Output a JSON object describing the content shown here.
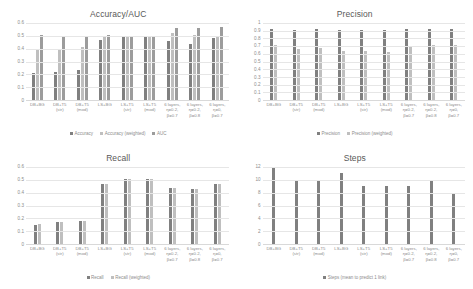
{
  "colors": {
    "series1": "#808080",
    "series2": "#bfbfbf",
    "series3": "#9c9c9c",
    "text": "#8c8c8c",
    "title": "#595959",
    "gridline": "#e6e6e6",
    "axis": "#d9d9d9",
    "background": "#ffffff"
  },
  "categories": [
    "DB+BG",
    "DB+T5\n(str)",
    "DB+T5\n(mod)",
    "LS+BG",
    "LS+T5\n(str)",
    "LS+T5\n(mod)",
    "6 layers,\nη=0.2,\nβ=0.7",
    "6 layers,\nη=0.2,\nβ=0.8",
    "6 layers,\nη=0,\nβ=0.7"
  ],
  "chart_data": [
    {
      "type": "bar",
      "title": "Accuracy/AUC",
      "xlabel": "",
      "ylabel": "",
      "ylim": [
        0,
        0.6
      ],
      "yticks": [
        0,
        0.1,
        0.2,
        0.3,
        0.4,
        0.5,
        0.6
      ],
      "ytick_labels": [
        "0",
        "0.1",
        "0.2",
        "0.3",
        "0.4",
        "0.5",
        "0.6"
      ],
      "grid": true,
      "legend_position": "bottom",
      "categories": [
        "DB+BG",
        "DB+T5\n(str)",
        "DB+T5\n(mod)",
        "LS+BG",
        "LS+T5\n(str)",
        "LS+T5\n(mod)",
        "6 layers,\nη=0.2,\nβ=0.7",
        "6 layers,\nη=0.2,\nβ=0.8",
        "6 layers,\nη=0,\nβ=0.7"
      ],
      "series": [
        {
          "name": "Accuracy",
          "color": "#808080",
          "values": [
            0.21,
            0.22,
            0.23,
            0.47,
            0.5,
            0.5,
            0.46,
            0.44,
            0.48
          ]
        },
        {
          "name": "Accuracy (weighted)",
          "color": "#bfbfbf",
          "values": [
            0.4,
            0.4,
            0.41,
            0.49,
            0.5,
            0.5,
            0.52,
            0.51,
            0.5
          ]
        },
        {
          "name": "AUC",
          "color": "#9c9c9c",
          "values": [
            0.51,
            0.5,
            0.5,
            0.51,
            0.5,
            0.5,
            0.56,
            0.56,
            0.57
          ]
        }
      ]
    },
    {
      "type": "bar",
      "title": "Precision",
      "xlabel": "",
      "ylabel": "",
      "ylim": [
        0,
        1
      ],
      "yticks": [
        0,
        0.1,
        0.2,
        0.3,
        0.4,
        0.5,
        0.6,
        0.7,
        0.8,
        0.9,
        1
      ],
      "ytick_labels": [
        "0",
        "0.1",
        "0.2",
        "0.3",
        "0.4",
        "0.5",
        "0.6",
        "0.7",
        "0.8",
        "0.9",
        "1"
      ],
      "grid": true,
      "legend_position": "bottom",
      "categories": [
        "DB+BG",
        "DB+T5\n(str)",
        "DB+T5\n(mod)",
        "LS+BG",
        "LS+T5\n(str)",
        "LS+T5\n(mod)",
        "6 layers,\nη=0.2,\nβ=0.7",
        "6 layers,\nη=0.2,\nβ=0.8",
        "6 layers,\nη=0,\nβ=0.7"
      ],
      "series": [
        {
          "name": "Precision",
          "color": "#808080",
          "values": [
            0.92,
            0.91,
            0.92,
            0.91,
            0.91,
            0.91,
            0.92,
            0.92,
            0.92
          ]
        },
        {
          "name": "Precision (weighted)",
          "color": "#bfbfbf",
          "values": [
            0.71,
            0.66,
            0.67,
            0.64,
            0.64,
            0.62,
            0.7,
            0.71,
            0.71
          ]
        }
      ]
    },
    {
      "type": "bar",
      "title": "Recall",
      "xlabel": "",
      "ylabel": "",
      "ylim": [
        0,
        0.6
      ],
      "yticks": [
        0,
        0.1,
        0.2,
        0.3,
        0.4,
        0.5,
        0.6
      ],
      "ytick_labels": [
        "0",
        "0.1",
        "0.2",
        "0.3",
        "0.4",
        "0.5",
        "0.6"
      ],
      "grid": true,
      "legend_position": "bottom",
      "categories": [
        "DB+BG",
        "DB+T5\n(str)",
        "DB+T5\n(mod)",
        "LS+BG",
        "LS+T5\n(str)",
        "LS+T5\n(mod)",
        "6 layers,\nη=0.2,\nβ=0.7",
        "6 layers,\nη=0.2,\nβ=0.8",
        "6 layers,\nη=0,\nβ=0.7"
      ],
      "series": [
        {
          "name": "Recall",
          "color": "#808080",
          "values": [
            0.15,
            0.175,
            0.18,
            0.465,
            0.505,
            0.51,
            0.44,
            0.425,
            0.465
          ]
        },
        {
          "name": "Recall (weighted)",
          "color": "#bfbfbf",
          "values": [
            0.155,
            0.175,
            0.18,
            0.465,
            0.505,
            0.51,
            0.435,
            0.425,
            0.465
          ]
        }
      ]
    },
    {
      "type": "bar",
      "title": "Steps",
      "xlabel": "",
      "ylabel": "",
      "ylim": [
        0,
        12
      ],
      "yticks": [
        0,
        2,
        4,
        6,
        8,
        10,
        12
      ],
      "ytick_labels": [
        "0",
        "2",
        "4",
        "6",
        "8",
        "10",
        "12"
      ],
      "grid": true,
      "legend_position": "bottom",
      "categories": [
        "DB+BG",
        "DB+T5\n(str)",
        "DB+T5\n(mod)",
        "LS+BG",
        "LS+T5\n(str)",
        "LS+T5\n(mod)",
        "6 layers,\nη=0.2,\nβ=0.7",
        "6 layers,\nη=0.2,\nβ=0.8",
        "6 layers,\nη=0,\nβ=0.7"
      ],
      "series": [
        {
          "name": "Steps (mean to predict 1 link)",
          "color": "#808080",
          "values": [
            12,
            10,
            10,
            11,
            9,
            9,
            9,
            10,
            8
          ]
        }
      ]
    }
  ]
}
